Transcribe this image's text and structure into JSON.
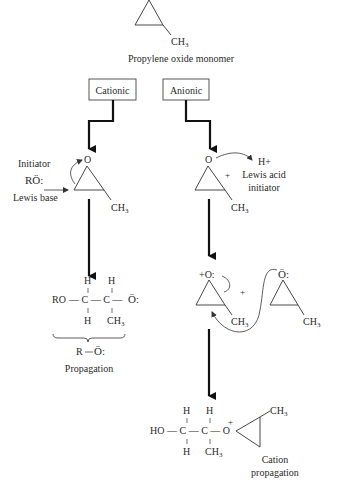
{
  "diagram": {
    "monomer_label": "Propylene oxide monomer",
    "monomer_substituent": "CH",
    "monomer_substituent_sub": "3",
    "branches": {
      "cationic": {
        "label": "Cationic"
      },
      "anionic": {
        "label": "Anionic"
      }
    },
    "cationic_path": {
      "initiator_label": "Initiator",
      "initiator_formula": "RÖ:",
      "lewis_base_label": "Lewis base",
      "ring_oxygen": "O",
      "ring_substituent": "CH",
      "ring_substituent_sub": "3",
      "product": {
        "row_top_h1": "H",
        "row_top_h2": "H",
        "left_group": "RO",
        "chain": "— C — C —",
        "end_group": "Ö:",
        "row_bottom_h": "H",
        "row_bottom_ch3": "CH",
        "row_bottom_ch3_sub": "3"
      },
      "brace_formula_r": "R",
      "brace_formula_o": "Ö:",
      "result_label": "Propagation"
    },
    "anionic_path": {
      "ring_oxygen": "O",
      "plus_sign": "+",
      "acid_formula": "H+",
      "acid_label_line1": "Lewis acid",
      "acid_label_line2": "initiator",
      "ring_substituent": "CH",
      "ring_substituent_sub": "3",
      "oxonium": "+O:",
      "plus_between": "+",
      "monomer_oxygen": "Ö:",
      "monomer_substituent": "CH",
      "monomer_substituent_sub": "3",
      "ring_substituent2": "CH",
      "ring_substituent2_sub": "3",
      "product": {
        "row_top_h1": "H",
        "row_top_h2": "H",
        "left_group": "HO",
        "chain": "— C — C — O",
        "oxonium_plus": "+",
        "row_bottom_h": "H",
        "row_bottom_ch3": "CH",
        "row_bottom_ch3_sub": "3",
        "ring_ch3": "CH",
        "ring_ch3_sub": "3"
      },
      "result_label_line1": "Cation",
      "result_label_line2": "propagation"
    }
  }
}
